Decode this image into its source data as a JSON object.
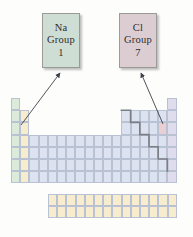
{
  "figure": {
    "type": "periodic-table-group-callout-diagram",
    "background": "#fdfdfc"
  },
  "callouts": [
    {
      "id": "na",
      "symbol": "Na",
      "group_label": "Group",
      "group_number": "1",
      "fill_color": "#cfded5",
      "border_color": "#9a9a96",
      "points_to": "sodium-cell"
    },
    {
      "id": "cl",
      "symbol": "Cl",
      "group_label": "Group",
      "group_number": "7",
      "fill_color": "#dccdd3",
      "border_color": "#9a9a96",
      "points_to": "chlorine-cell"
    }
  ],
  "periodic_table": {
    "columns": 18,
    "rows": 7,
    "cell_width": 9.2,
    "cell_height": 12.2,
    "origin_x": 11,
    "origin_y": 98,
    "colors": {
      "group_1": "#dcead9",
      "group_2": "#f7eccd",
      "main_block": "#dce2ef",
      "group_18": "#dfdcee",
      "highlight_sodium": "#dcead9",
      "highlight_chlorine": "#e7cfd4",
      "f_block": "#f7eccd",
      "grid_line": "#b9c2d2",
      "staircase": "#7b7f86"
    },
    "f_block": {
      "columns": 14,
      "rows": 2,
      "origin_x": 48,
      "origin_y": 194,
      "fill": "#f7eccd"
    },
    "highlighted_cells": [
      {
        "name": "sodium-cell",
        "symbol": "Na",
        "group": 1,
        "period": 3
      },
      {
        "name": "chlorine-cell",
        "symbol": "Cl",
        "group": 17,
        "period": 3
      }
    ],
    "staircase_label": "metal-nonmetal-dividing-line"
  }
}
